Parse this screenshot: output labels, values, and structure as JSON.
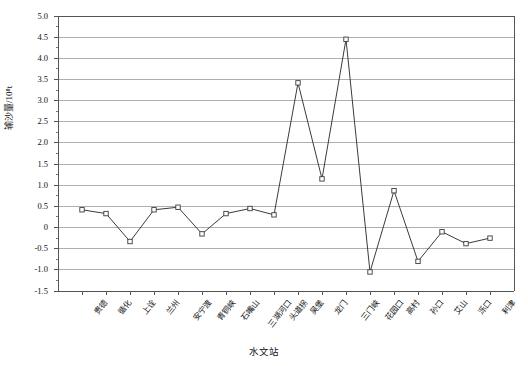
{
  "chart_data": {
    "type": "line",
    "title": "",
    "xlabel": "水文站",
    "ylabel": "输沙量/10⁸t",
    "ylim": [
      -1.5,
      5.0
    ],
    "ytick_step": 0.5,
    "grid": true,
    "legend": "none",
    "marker": "open-square",
    "line_color": "#3b3b3b",
    "grid_color": "#9a9a9a",
    "axis_color": "#555555",
    "categories": [
      "贵德",
      "循化",
      "上诠",
      "兰州",
      "安宁渡",
      "青铜峡",
      "石嘴山",
      "三湖河口",
      "头道拐",
      "吴堡",
      "龙门",
      "三门峡",
      "花园口",
      "高村",
      "孙口",
      "艾山",
      "泺口",
      "利津"
    ],
    "values": [
      0.42,
      0.33,
      -0.33,
      0.42,
      0.48,
      -0.15,
      0.33,
      0.45,
      0.3,
      3.42,
      1.15,
      4.45,
      -1.05,
      0.87,
      -0.8,
      -0.1,
      -0.38,
      -0.25
    ],
    "ytick_labels": [
      "5.0",
      "4.5",
      "4.0",
      "3.5",
      "3.0",
      "2.5",
      "2.0",
      "1.5",
      "1.0",
      "0.5",
      "0",
      "-0.5",
      "-1.0",
      "-1.5"
    ]
  }
}
